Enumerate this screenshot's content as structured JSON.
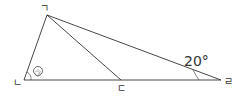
{
  "diagram": {
    "vertices": {
      "top": "ㄱ",
      "bottom_left": "ㄴ",
      "bottom_middle": "ㄷ",
      "right": "ㄹ"
    },
    "angle_marker": "㉠",
    "angle_value": "20°",
    "colors": {
      "line": "#333333"
    }
  }
}
